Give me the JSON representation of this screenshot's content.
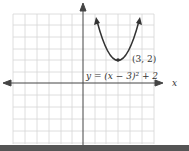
{
  "figure": {
    "equation": "y = (x − 3)² + 2",
    "vertex_label": "(3, 2)",
    "x_axis_label": "x",
    "vertex": [
      3,
      2
    ],
    "grid": {
      "x_min": -6,
      "x_max": 6,
      "y_min": -5,
      "y_max": 6
    },
    "colors": {
      "grid": "#d0d0d0",
      "axis": "#444444",
      "curve": "#333333",
      "bottom_bar": "#555555"
    }
  }
}
